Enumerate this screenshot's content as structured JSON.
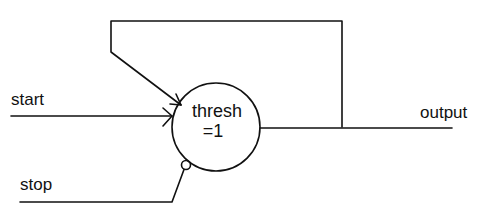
{
  "diagram": {
    "type": "threshold-unit-circuit",
    "node": {
      "name": "thresh",
      "line1": "thresh",
      "line2": "=1"
    },
    "inputs": [
      {
        "label": "start",
        "connection": "excitatory"
      },
      {
        "label": "stop",
        "connection": "inhibitory"
      }
    ],
    "output": {
      "label": "output"
    },
    "feedback": {
      "from": "output",
      "to": "thresh",
      "connection": "excitatory"
    },
    "colors": {
      "stroke": "#111111",
      "background": "#ffffff"
    }
  }
}
